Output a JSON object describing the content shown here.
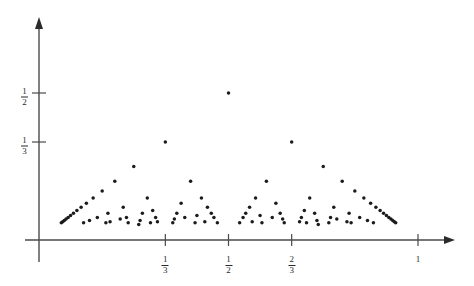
{
  "chart_data": {
    "type": "scatter",
    "title": "",
    "subtitle": "",
    "xlabel": "",
    "ylabel": "",
    "xlim": [
      -0.035,
      1.15
    ],
    "ylim": [
      -0.06,
      0.77
    ],
    "grid": false,
    "legend": null,
    "x_ticks": [
      {
        "value": 0.3333333333,
        "label": "1/3",
        "numerator": "1",
        "denominator": "3"
      },
      {
        "value": 0.5,
        "label": "1/2",
        "numerator": "1",
        "denominator": "2"
      },
      {
        "value": 0.6666666667,
        "label": "2/3",
        "numerator": "2",
        "denominator": "3"
      },
      {
        "value": 1.0,
        "label": "1",
        "numerator": "1",
        "denominator": ""
      }
    ],
    "y_ticks": [
      {
        "value": 0.5,
        "label": "1/2",
        "numerator": "1",
        "denominator": "2"
      },
      {
        "value": 0.3333333333,
        "label": "1/3",
        "numerator": "1",
        "denominator": "3"
      }
    ],
    "max_denominator": 17,
    "point_color": "#1b1b1b",
    "axis_color": "#4a4a4a",
    "points": [
      {
        "x": 0.058823529,
        "y": 0.058823529
      },
      {
        "x": 0.0625,
        "y": 0.0625
      },
      {
        "x": 0.066666667,
        "y": 0.066666667
      },
      {
        "x": 0.071428571,
        "y": 0.071428571
      },
      {
        "x": 0.076923077,
        "y": 0.076923077
      },
      {
        "x": 0.083333333,
        "y": 0.083333333
      },
      {
        "x": 0.090909091,
        "y": 0.090909091
      },
      {
        "x": 0.1,
        "y": 0.1
      },
      {
        "x": 0.111111111,
        "y": 0.111111111
      },
      {
        "x": 0.117647059,
        "y": 0.058823529
      },
      {
        "x": 0.125,
        "y": 0.125
      },
      {
        "x": 0.133333333,
        "y": 0.066666667
      },
      {
        "x": 0.142857143,
        "y": 0.142857143
      },
      {
        "x": 0.153846154,
        "y": 0.076923077
      },
      {
        "x": 0.166666667,
        "y": 0.166666667
      },
      {
        "x": 0.176470588,
        "y": 0.058823529
      },
      {
        "x": 0.181818182,
        "y": 0.090909091
      },
      {
        "x": 0.1875,
        "y": 0.0625
      },
      {
        "x": 0.2,
        "y": 0.2
      },
      {
        "x": 0.214285714,
        "y": 0.071428571
      },
      {
        "x": 0.222222222,
        "y": 0.111111111
      },
      {
        "x": 0.230769231,
        "y": 0.076923077
      },
      {
        "x": 0.235294118,
        "y": 0.058823529
      },
      {
        "x": 0.25,
        "y": 0.25
      },
      {
        "x": 0.263157895,
        "y": 0.052631579
      },
      {
        "x": 0.266666667,
        "y": 0.066666667
      },
      {
        "x": 0.272727273,
        "y": 0.090909091
      },
      {
        "x": 0.285714286,
        "y": 0.142857143
      },
      {
        "x": 0.294117647,
        "y": 0.058823529
      },
      {
        "x": 0.3,
        "y": 0.1
      },
      {
        "x": 0.307692308,
        "y": 0.076923077
      },
      {
        "x": 0.3125,
        "y": 0.0625
      },
      {
        "x": 0.333333333,
        "y": 0.333333333
      },
      {
        "x": 0.352941176,
        "y": 0.058823529
      },
      {
        "x": 0.357142857,
        "y": 0.071428571
      },
      {
        "x": 0.363636364,
        "y": 0.090909091
      },
      {
        "x": 0.375,
        "y": 0.125
      },
      {
        "x": 0.384615385,
        "y": 0.076923077
      },
      {
        "x": 0.4,
        "y": 0.2
      },
      {
        "x": 0.411764706,
        "y": 0.058823529
      },
      {
        "x": 0.416666667,
        "y": 0.083333333
      },
      {
        "x": 0.428571429,
        "y": 0.142857143
      },
      {
        "x": 0.4375,
        "y": 0.0625
      },
      {
        "x": 0.444444444,
        "y": 0.111111111
      },
      {
        "x": 0.454545455,
        "y": 0.090909091
      },
      {
        "x": 0.461538462,
        "y": 0.076923077
      },
      {
        "x": 0.470588235,
        "y": 0.058823529
      },
      {
        "x": 0.5,
        "y": 0.5
      },
      {
        "x": 0.529411765,
        "y": 0.058823529
      },
      {
        "x": 0.538461538,
        "y": 0.076923077
      },
      {
        "x": 0.545454545,
        "y": 0.090909091
      },
      {
        "x": 0.555555556,
        "y": 0.111111111
      },
      {
        "x": 0.5625,
        "y": 0.0625
      },
      {
        "x": 0.571428571,
        "y": 0.142857143
      },
      {
        "x": 0.583333333,
        "y": 0.083333333
      },
      {
        "x": 0.588235294,
        "y": 0.058823529
      },
      {
        "x": 0.6,
        "y": 0.2
      },
      {
        "x": 0.615384615,
        "y": 0.076923077
      },
      {
        "x": 0.625,
        "y": 0.125
      },
      {
        "x": 0.636363636,
        "y": 0.090909091
      },
      {
        "x": 0.642857143,
        "y": 0.071428571
      },
      {
        "x": 0.647058824,
        "y": 0.058823529
      },
      {
        "x": 0.666666667,
        "y": 0.333333333
      },
      {
        "x": 0.6875,
        "y": 0.0625
      },
      {
        "x": 0.692307692,
        "y": 0.076923077
      },
      {
        "x": 0.7,
        "y": 0.1
      },
      {
        "x": 0.705882353,
        "y": 0.058823529
      },
      {
        "x": 0.714285714,
        "y": 0.142857143
      },
      {
        "x": 0.727272727,
        "y": 0.090909091
      },
      {
        "x": 0.733333333,
        "y": 0.066666667
      },
      {
        "x": 0.736842105,
        "y": 0.052631579
      },
      {
        "x": 0.75,
        "y": 0.25
      },
      {
        "x": 0.764705882,
        "y": 0.058823529
      },
      {
        "x": 0.769230769,
        "y": 0.076923077
      },
      {
        "x": 0.777777778,
        "y": 0.111111111
      },
      {
        "x": 0.785714286,
        "y": 0.071428571
      },
      {
        "x": 0.8,
        "y": 0.2
      },
      {
        "x": 0.8125,
        "y": 0.0625
      },
      {
        "x": 0.818181818,
        "y": 0.090909091
      },
      {
        "x": 0.823529412,
        "y": 0.058823529
      },
      {
        "x": 0.833333333,
        "y": 0.166666667
      },
      {
        "x": 0.846153846,
        "y": 0.076923077
      },
      {
        "x": 0.857142857,
        "y": 0.142857143
      },
      {
        "x": 0.866666667,
        "y": 0.066666667
      },
      {
        "x": 0.875,
        "y": 0.125
      },
      {
        "x": 0.882352941,
        "y": 0.058823529
      },
      {
        "x": 0.888888889,
        "y": 0.111111111
      },
      {
        "x": 0.9,
        "y": 0.1
      },
      {
        "x": 0.909090909,
        "y": 0.090909091
      },
      {
        "x": 0.916666667,
        "y": 0.083333333
      },
      {
        "x": 0.923076923,
        "y": 0.076923077
      },
      {
        "x": 0.928571429,
        "y": 0.071428571
      },
      {
        "x": 0.933333333,
        "y": 0.066666667
      },
      {
        "x": 0.9375,
        "y": 0.0625
      },
      {
        "x": 0.941176471,
        "y": 0.058823529
      }
    ]
  },
  "axes": {
    "origin_px": {
      "x": 39,
      "y": 240
    },
    "x_unit_px": 379,
    "y_unit_px": 294,
    "x_axis_end_px": 455,
    "y_axis_top_px": 18
  }
}
